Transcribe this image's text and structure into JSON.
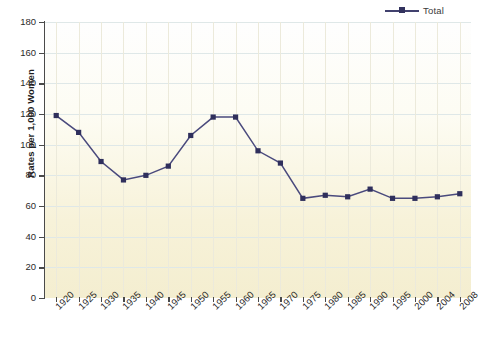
{
  "legend": {
    "entries": [
      {
        "label": "Total",
        "color": "#41416e",
        "marker": "square"
      }
    ],
    "position": "top-right"
  },
  "axes": {
    "ylabel": "Rates per 1,000 Women",
    "xlabel": "",
    "yticks": [
      0,
      20,
      40,
      60,
      80,
      100,
      120,
      140,
      160,
      180
    ],
    "ylim": [
      0,
      180
    ],
    "grid": "horizontal-and-vertical"
  },
  "chart_data": {
    "type": "line",
    "title": "",
    "xlabel": "",
    "ylabel": "Rates per 1,000 Women",
    "ylim": [
      0,
      180
    ],
    "yticks": [
      0,
      20,
      40,
      60,
      80,
      100,
      120,
      140,
      160,
      180
    ],
    "grid": true,
    "legend_position": "top-right",
    "categories": [
      "1920",
      "1925",
      "1930",
      "1935",
      "1940",
      "1945",
      "1950",
      "1955",
      "1960",
      "1965",
      "1970",
      "1975",
      "1980",
      "1985",
      "1990",
      "1995",
      "2000",
      "2004",
      "2008"
    ],
    "series": [
      {
        "name": "Total",
        "color": "#41416e",
        "values": [
          119,
          108,
          89,
          77,
          80,
          86,
          106,
          118,
          118,
          96,
          88,
          65,
          67,
          66,
          71,
          65,
          65,
          66,
          68
        ]
      }
    ]
  },
  "colors": {
    "line": "#4a4a7d",
    "marker": "#2f2f5c",
    "axis": "#4a4a4a",
    "gridline": "#dfe8e8",
    "plot_background_top": "#fefefe",
    "plot_background_bottom": "#f4eed0"
  }
}
